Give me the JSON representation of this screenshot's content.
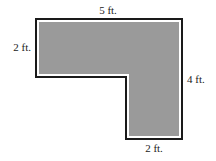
{
  "diagram": {
    "shape": "L-shaped region",
    "colors": {
      "fill": "#9a9a9a",
      "inner_border": "#ffffff",
      "outline": "#1a1a1a",
      "text": "#222222"
    },
    "labels": {
      "top": "5 ft.",
      "left": "2 ft.",
      "right": "4 ft.",
      "bottom": "2 ft."
    }
  }
}
